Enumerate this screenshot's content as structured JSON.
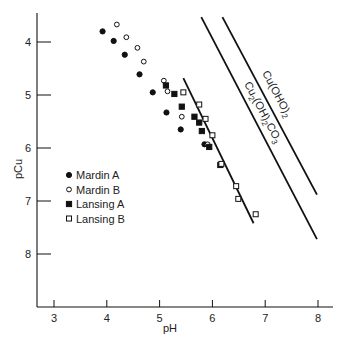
{
  "chart_data": {
    "type": "scatter",
    "title": "",
    "xlabel": "pH",
    "ylabel": "pCu",
    "xlim": [
      2.7,
      8.3
    ],
    "ylim": [
      3.4,
      9.0
    ],
    "y_inverted": true,
    "x_ticks": [
      3,
      4,
      5,
      6,
      7,
      8
    ],
    "y_ticks": [
      4,
      5,
      6,
      7,
      8
    ],
    "grid": false,
    "legend_position": "center-left",
    "series": [
      {
        "name": "Mardin A",
        "marker": "filled-circle",
        "points": [
          {
            "x": 3.92,
            "y": 3.8
          },
          {
            "x": 4.13,
            "y": 3.98
          },
          {
            "x": 4.34,
            "y": 4.24
          },
          {
            "x": 4.62,
            "y": 4.61
          },
          {
            "x": 4.87,
            "y": 4.95
          },
          {
            "x": 5.13,
            "y": 5.33
          },
          {
            "x": 5.4,
            "y": 5.65
          },
          {
            "x": 5.85,
            "y": 5.93
          }
        ]
      },
      {
        "name": "Mardin B",
        "marker": "open-circle",
        "points": [
          {
            "x": 4.19,
            "y": 3.67
          },
          {
            "x": 4.37,
            "y": 3.91
          },
          {
            "x": 4.58,
            "y": 4.11
          },
          {
            "x": 4.7,
            "y": 4.37
          },
          {
            "x": 5.08,
            "y": 4.73
          },
          {
            "x": 5.15,
            "y": 4.93
          },
          {
            "x": 5.42,
            "y": 5.41
          },
          {
            "x": 5.91,
            "y": 5.93
          }
        ]
      },
      {
        "name": "Lansing A",
        "marker": "filled-square",
        "points": [
          {
            "x": 5.12,
            "y": 4.82
          },
          {
            "x": 5.28,
            "y": 4.98
          },
          {
            "x": 5.42,
            "y": 5.22
          },
          {
            "x": 5.66,
            "y": 5.41
          },
          {
            "x": 5.8,
            "y": 5.68
          },
          {
            "x": 5.94,
            "y": 5.98
          },
          {
            "x": 6.15,
            "y": 6.32
          },
          {
            "x": 5.75,
            "y": 5.52
          }
        ]
      },
      {
        "name": "Lansing B",
        "marker": "open-square",
        "points": [
          {
            "x": 5.45,
            "y": 4.95
          },
          {
            "x": 5.75,
            "y": 5.18
          },
          {
            "x": 5.87,
            "y": 5.45
          },
          {
            "x": 6.0,
            "y": 5.76
          },
          {
            "x": 6.17,
            "y": 6.3
          },
          {
            "x": 6.45,
            "y": 6.72
          },
          {
            "x": 6.49,
            "y": 6.96
          },
          {
            "x": 6.82,
            "y": 7.25
          }
        ]
      }
    ],
    "lines": [
      {
        "name": "data-fit",
        "label": "",
        "x": [
          5.45,
          6.78
        ],
        "y": [
          4.68,
          7.42
        ]
      },
      {
        "name": "Cu2(OH)2CO3 solubility",
        "label": "Cu₂(OH)₂CO₃",
        "x": [
          5.79,
          7.98
        ],
        "y": [
          3.53,
          7.72
        ]
      },
      {
        "name": "Cu(OH)2 solubility",
        "label": "Cu(OHO)₂",
        "x": [
          6.19,
          7.98
        ],
        "y": [
          3.53,
          6.88
        ]
      }
    ]
  },
  "axes": {
    "xlabel": "pH",
    "ylabel": "pCu",
    "x_tick_labels": [
      "3",
      "4",
      "5",
      "6",
      "7",
      "8"
    ],
    "y_tick_labels": [
      "4",
      "5",
      "6",
      "7",
      "8"
    ]
  },
  "legend": {
    "items": [
      {
        "label": "Mardin A",
        "marker": "filled-circle"
      },
      {
        "label": "Mardin B",
        "marker": "open-circle"
      },
      {
        "label": "Lansing A",
        "marker": "filled-square"
      },
      {
        "label": "Lansing B",
        "marker": "open-square"
      }
    ]
  },
  "annotations": {
    "cuoh2_main": "Cu(OHO)",
    "cuoh2_sub": "2",
    "carb_cu": "Cu",
    "carb_sub1": "2",
    "carb_oh": "(OH)",
    "carb_sub2": "2",
    "carb_co": "CO",
    "carb_sub3": "3"
  },
  "colors": {
    "ink": "#111111",
    "background": "#ffffff"
  }
}
